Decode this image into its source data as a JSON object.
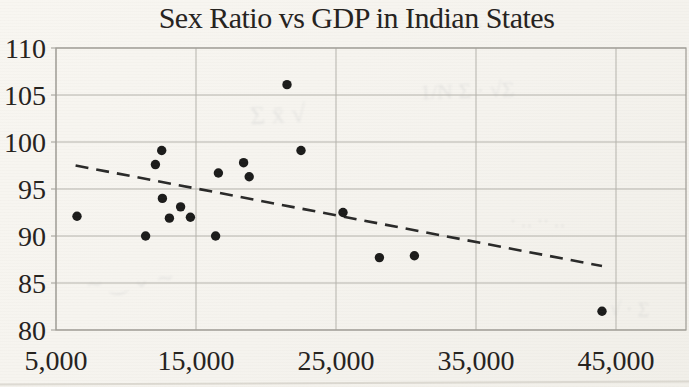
{
  "chart_data": {
    "type": "scatter",
    "title": "Sex Ratio vs GDP in Indian States",
    "xlabel": "",
    "ylabel": "",
    "x_axis": {
      "min": 5000,
      "max": 50000,
      "tick_values": [
        5000,
        15000,
        25000,
        35000,
        45000
      ],
      "tick_labels": [
        "5,000",
        "15,000",
        "25,000",
        "35,000",
        "45,000"
      ]
    },
    "y_axis": {
      "min": 80,
      "max": 110,
      "tick_values": [
        80,
        85,
        90,
        95,
        100,
        105,
        110
      ],
      "tick_labels": [
        "80",
        "85",
        "90",
        "95",
        "100",
        "105",
        "110"
      ]
    },
    "grid": true,
    "legend": "none",
    "points": [
      [
        6500,
        92.1
      ],
      [
        11400,
        90.0
      ],
      [
        12100,
        97.6
      ],
      [
        12550,
        99.1
      ],
      [
        12600,
        94.0
      ],
      [
        13100,
        91.9
      ],
      [
        13900,
        93.1
      ],
      [
        14600,
        92.0
      ],
      [
        16400,
        90.0
      ],
      [
        16600,
        96.7
      ],
      [
        18400,
        97.8
      ],
      [
        18800,
        96.3
      ],
      [
        21500,
        106.1
      ],
      [
        22500,
        99.1
      ],
      [
        25500,
        92.5
      ],
      [
        28100,
        87.7
      ],
      [
        30600,
        87.9
      ],
      [
        44000,
        82.0
      ]
    ],
    "trend_line": {
      "style": "dashed",
      "x1": 6400,
      "y1": 97.5,
      "x2": 44000,
      "y2": 86.8
    },
    "colors": {
      "point": "#1c1c1b",
      "trend": "#2a2a29",
      "grid": "#b5b3ac",
      "border": "#9e9c95",
      "text": "#26231e",
      "paper": "#f5f3ee"
    }
  },
  "artifacts": {
    "showthrough": [
      {
        "text": "– ‥ — ·‥ – ‥ —",
        "x": 420,
        "y": 12,
        "size": 16,
        "rot": -1,
        "opacity": 0.12
      },
      {
        "text": "Σ  x̄  √",
        "x": 250,
        "y": 100,
        "size": 26,
        "rot": -3,
        "opacity": 0.1
      },
      {
        "text": "1/N Σ · √Σ",
        "x": 420,
        "y": 78,
        "size": 22,
        "rot": -2,
        "opacity": 0.1
      },
      {
        "text": "∼ ‿ ⌄ ∼",
        "x": 85,
        "y": 268,
        "size": 22,
        "rot": -5,
        "opacity": 0.1
      },
      {
        "text": "· ‥ ·· ‥",
        "x": 510,
        "y": 210,
        "size": 18,
        "rot": 0,
        "opacity": 0.11
      },
      {
        "text": "√ · Σ",
        "x": 610,
        "y": 298,
        "size": 20,
        "rot": 3,
        "opacity": 0.1
      }
    ]
  }
}
